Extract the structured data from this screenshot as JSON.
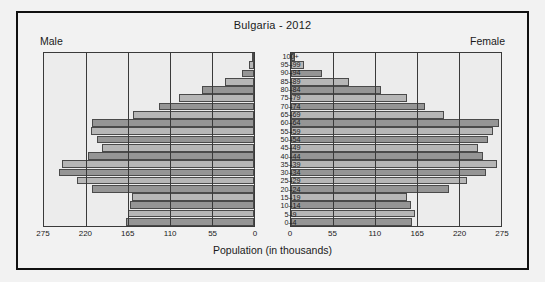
{
  "chart_data": {
    "type": "bar",
    "subtype": "population-pyramid",
    "title": "Bulgaria - 2012",
    "xlabel": "Population (in thousands)",
    "ylabel": "",
    "xlim": [
      0,
      275
    ],
    "xticks": [
      275,
      220,
      165,
      110,
      55,
      0
    ],
    "xticks_right": [
      0,
      55,
      110,
      165,
      220,
      275
    ],
    "grid": true,
    "legend": false,
    "side_labels": {
      "left": "Male",
      "right": "Female"
    },
    "categories": [
      "100+",
      "95-99",
      "90-94",
      "85-89",
      "80-84",
      "75-79",
      "70-74",
      "65-69",
      "60-64",
      "55-59",
      "50-54",
      "45-49",
      "40-44",
      "35-39",
      "30-34",
      "25-29",
      "20-24",
      "15-19",
      "10-14",
      "5-9",
      "0-4"
    ],
    "series": [
      {
        "name": "Male",
        "values": [
          2,
          7,
          16,
          38,
          68,
          98,
          124,
          158,
          212,
          213,
          205,
          199,
          218,
          252,
          256,
          232,
          212,
          160,
          163,
          165,
          167
        ]
      },
      {
        "name": "Female",
        "values": [
          5,
          17,
          40,
          76,
          118,
          152,
          175,
          201,
          272,
          264,
          258,
          245,
          252,
          270,
          255,
          230,
          207,
          152,
          157,
          163,
          159
        ]
      }
    ],
    "colors": {
      "bar_light": "#b6b6b6",
      "bar_dark": "#959595",
      "bar_border": "#4a4a4a",
      "panel_background": "#ececec",
      "figure_background": "#f2f2f2",
      "frame_border": "#111111",
      "gridline": "#3a3a3a",
      "text": "#1a1a1a"
    }
  }
}
